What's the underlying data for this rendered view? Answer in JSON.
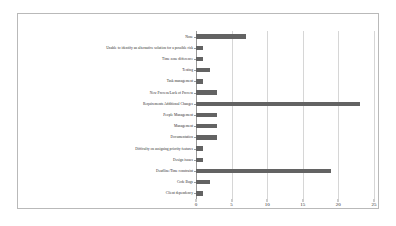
{
  "chart_data": {
    "type": "bar",
    "orientation": "horizontal",
    "title": "",
    "subtitle": "",
    "xlabel": "",
    "ylabel": "",
    "xlim": [
      0,
      26
    ],
    "xticks": [
      0,
      5,
      10,
      15,
      20,
      25
    ],
    "xtick_labels": [
      "0",
      "5",
      "10",
      "15",
      "20",
      "25"
    ],
    "grid": true,
    "legend": false,
    "legend_position": "none",
    "bar_color": "#636363",
    "gridline_color": "#d6d6d6",
    "axis_color": "#9a9a9a",
    "frame_color": "#b9b9b9",
    "background_color": "#ffffff",
    "text_color": "#2b2b2b",
    "categories": [
      "None",
      "Unable to identify an alternative solution for a possible risk",
      "Time zone difference",
      "Testing",
      "Task management",
      "New Process/Lack of Process",
      "Requirements Additional Changes",
      "People Management",
      "Management",
      "Documentation",
      "Difficulty on assigning priority features",
      "Design issues",
      "Deadline/Time constraint",
      "Code Bugs",
      "Client dependency"
    ],
    "values": [
      7,
      1,
      1,
      2,
      1,
      3,
      23,
      3,
      3,
      3,
      1,
      1,
      19,
      2,
      1
    ]
  }
}
